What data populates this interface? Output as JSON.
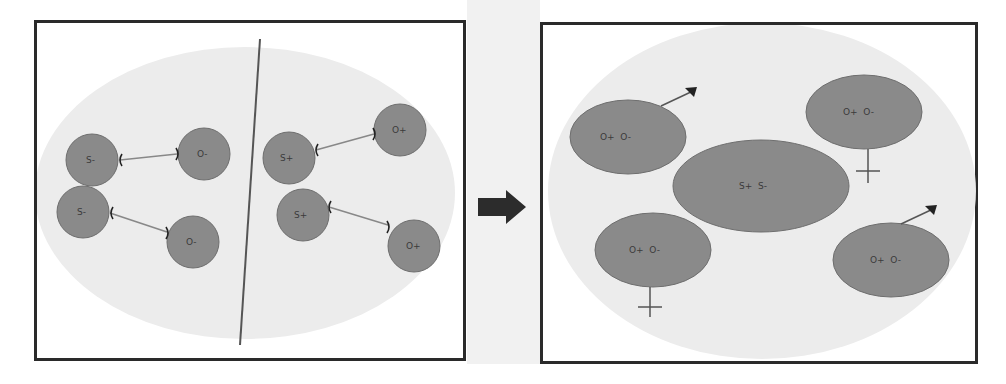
{
  "colors": {
    "cell_fill": "#8a8a8a",
    "cell_stroke": "#6e6e6e",
    "field_fill": "#ececec",
    "border": "#2a2a2a",
    "arrow": "#2c2c2c"
  },
  "left_panel": {
    "cells": [
      {
        "label": "S-"
      },
      {
        "label": "O-"
      },
      {
        "label": "S-"
      },
      {
        "label": "O-"
      },
      {
        "label": "S+"
      },
      {
        "label": "O+"
      },
      {
        "label": "S+"
      },
      {
        "label": "O+"
      }
    ]
  },
  "right_panel": {
    "cells": [
      {
        "label": "O+  O-",
        "symbol": "male"
      },
      {
        "label": "O+  O-",
        "symbol": "female"
      },
      {
        "label": "S+  S-",
        "symbol": "none"
      },
      {
        "label": "O+  O-",
        "symbol": "female"
      },
      {
        "label": "O+  O-",
        "symbol": "male"
      }
    ]
  },
  "transition_arrow": {
    "icon": "right-arrow-icon"
  }
}
